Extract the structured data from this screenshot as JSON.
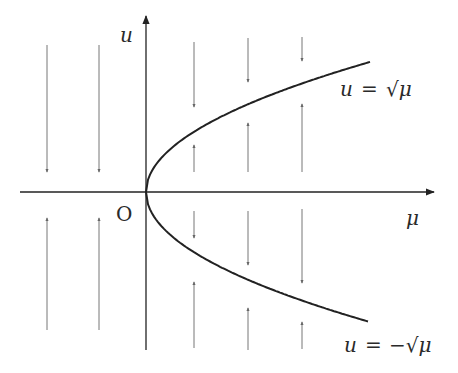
{
  "diagram": {
    "type": "saddle-node bifurcation diagram",
    "axes": {
      "x_label": "μ",
      "y_label": "u",
      "origin_label": "O"
    },
    "branches": [
      {
        "label_var": "u",
        "label_eq": "=",
        "label_expr": "√μ",
        "description": "upper branch u = √μ"
      },
      {
        "label_var": "u",
        "label_eq": "=",
        "label_expr": "−√μ",
        "description": "lower branch u = −√μ"
      }
    ],
    "flow_arrows": {
      "left_region": [
        {
          "x": 47,
          "segments": [
            {
              "y1": 45,
              "y2": 172,
              "dir": "down"
            },
            {
              "y1": 330,
              "y2": 218,
              "dir": "up"
            }
          ]
        },
        {
          "x": 99,
          "segments": [
            {
              "y1": 45,
              "y2": 172,
              "dir": "down"
            },
            {
              "y1": 330,
              "y2": 218,
              "dir": "up"
            }
          ]
        }
      ],
      "right_region": [
        {
          "x": 194,
          "segments": [
            {
              "y1": 42,
              "y2": 107,
              "dir": "down"
            },
            {
              "y1": 172,
              "y2": 145,
              "dir": "up"
            },
            {
              "y1": 211,
              "y2": 238,
              "dir": "down"
            },
            {
              "y1": 348,
              "y2": 282,
              "dir": "up"
            }
          ]
        },
        {
          "x": 248,
          "segments": [
            {
              "y1": 38,
              "y2": 82,
              "dir": "down"
            },
            {
              "y1": 172,
              "y2": 123,
              "dir": "up"
            },
            {
              "y1": 211,
              "y2": 265,
              "dir": "down"
            },
            {
              "y1": 350,
              "y2": 308,
              "dir": "up"
            }
          ]
        },
        {
          "x": 302,
          "segments": [
            {
              "y1": 37,
              "y2": 61,
              "dir": "down"
            },
            {
              "y1": 172,
              "y2": 104,
              "dir": "up"
            },
            {
              "y1": 209,
              "y2": 283,
              "dir": "down"
            },
            {
              "y1": 349,
              "y2": 322,
              "dir": "up"
            }
          ]
        }
      ]
    },
    "colors": {
      "axis": "#222222",
      "curve": "#222222",
      "arrow": "#777777",
      "text": "#2a2a2a"
    }
  }
}
